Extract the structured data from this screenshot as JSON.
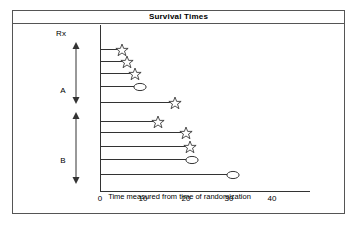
{
  "chart_data": {
    "type": "bar",
    "title": "Survival Times",
    "xlabel": "Time measured from time of randomization",
    "ylabel": "Rx",
    "grid": false,
    "legend": "none",
    "xlim": [
      0,
      45
    ],
    "xticks": [
      0,
      10,
      20,
      30,
      40
    ],
    "xtick_labels": [
      "0",
      "10",
      "20",
      "30",
      "40"
    ],
    "groups": [
      {
        "name": "A",
        "label": "A",
        "bars": [
          {
            "id": "a1",
            "value": 5,
            "marker": "star",
            "label": "5"
          },
          {
            "id": "a2",
            "value": 6.3,
            "marker": "star",
            "label": "6.3"
          },
          {
            "id": "a3",
            "value": 8.1,
            "marker": "star",
            "label": "8.1"
          },
          {
            "id": "a4",
            "value": 9.3,
            "marker": "ellipse",
            "label": "9.3"
          },
          {
            "id": "a5",
            "value": 17.4,
            "marker": "star",
            "label": "17.4"
          }
        ]
      },
      {
        "name": "B",
        "label": "B",
        "bars": [
          {
            "id": "b1",
            "value": 13.5,
            "marker": "star",
            "label": "13.5"
          },
          {
            "id": "b2",
            "value": 20.0,
            "marker": "star",
            "label": "20.0"
          },
          {
            "id": "b3",
            "value": 21.0,
            "marker": "star",
            "label": "21.0"
          },
          {
            "id": "b4",
            "value": 21.4,
            "marker": "ellipse",
            "label": "21.4"
          },
          {
            "id": "b5",
            "value": 31.0,
            "marker": "ellipse",
            "label": "31.0"
          }
        ]
      }
    ],
    "marker_legend": {
      "star": "star-marker",
      "ellipse": "ellipse-marker"
    },
    "colors": {
      "line": "#333333",
      "border": "#555555",
      "background": "#ffffff",
      "text": "#000000"
    }
  }
}
